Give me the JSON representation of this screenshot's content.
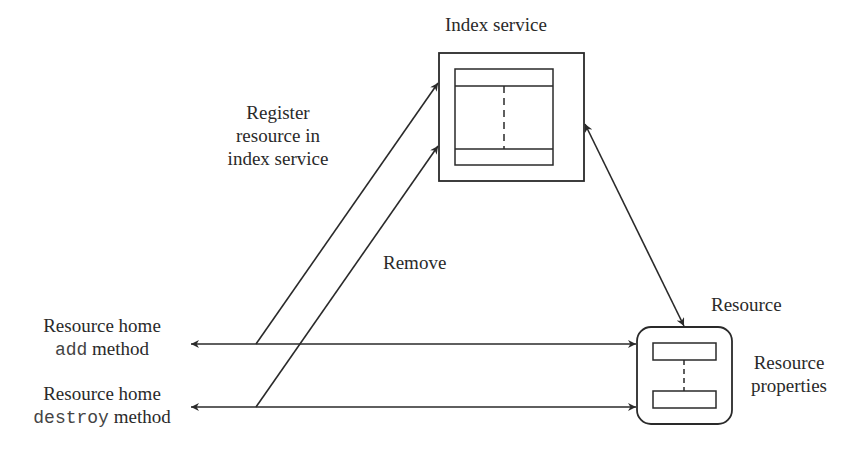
{
  "diagram": {
    "index_service": {
      "label": "Index service"
    },
    "resource": {
      "label": "Resource",
      "properties_label_line1": "Resource",
      "properties_label_line2": "properties"
    },
    "register_label": {
      "line1": "Register",
      "line2": "resource in",
      "line3": "index service"
    },
    "remove_label": "Remove",
    "add_method": {
      "line1": "Resource home",
      "code": "add",
      "suffix": " method"
    },
    "destroy_method": {
      "line1": "Resource home",
      "code": "destroy",
      "suffix": " method"
    }
  },
  "colors": {
    "stroke": "#2a2a2a",
    "background": "#ffffff"
  }
}
